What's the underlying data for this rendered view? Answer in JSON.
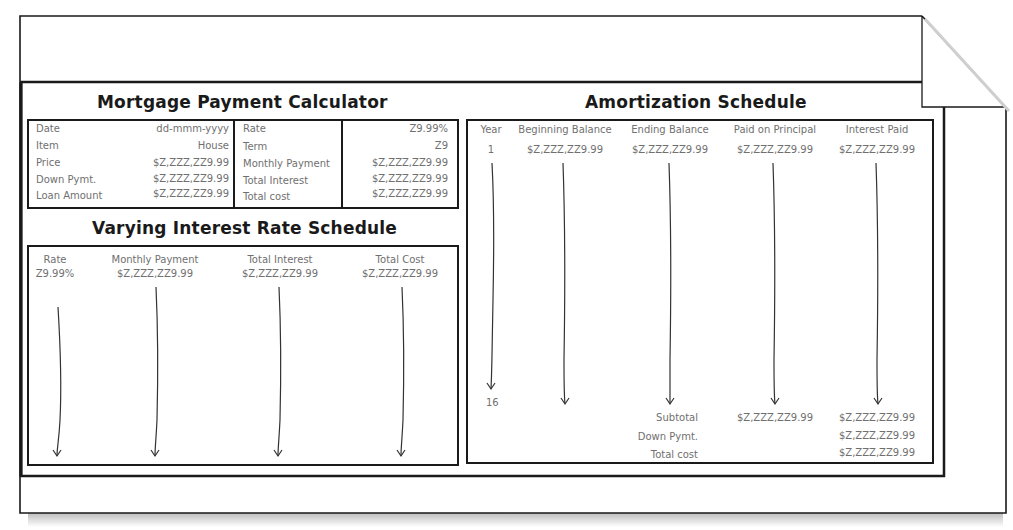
{
  "calculator": {
    "title": "Mortgage Payment Calculator",
    "left_rows": [
      {
        "label": "Date",
        "value": "dd-mmm-yyyy"
      },
      {
        "label": "Item",
        "value": "House"
      },
      {
        "label": "Price",
        "value": "$Z,ZZZ,ZZ9.99"
      },
      {
        "label": "Down Pymt.",
        "value": "$Z,ZZZ,ZZ9.99"
      },
      {
        "label": "Loan Amount",
        "value": "$Z,ZZZ,ZZ9.99"
      }
    ],
    "right_rows": [
      {
        "label": "Rate",
        "value": "Z9.99%"
      },
      {
        "label": "Term",
        "value": "Z9"
      },
      {
        "label": "Monthly Payment",
        "value": "$Z,ZZZ,ZZ9.99"
      },
      {
        "label": "Total Interest",
        "value": "$Z,ZZZ,ZZ9.99"
      },
      {
        "label": "Total cost",
        "value": "$Z,ZZZ,ZZ9.99"
      }
    ]
  },
  "varying": {
    "title": "Varying Interest Rate Schedule",
    "columns": [
      {
        "header": "Rate",
        "value": "Z9.99%"
      },
      {
        "header": "Monthly Payment",
        "value": "$Z,ZZZ,ZZ9.99"
      },
      {
        "header": "Total Interest",
        "value": "$Z,ZZZ,ZZ9.99"
      },
      {
        "header": "Total Cost",
        "value": "$Z,ZZZ,ZZ9.99"
      }
    ]
  },
  "amortization": {
    "title": "Amortization Schedule",
    "columns": [
      {
        "header": "Year",
        "value": "1"
      },
      {
        "header": "Beginning Balance",
        "value": "$Z,ZZZ,ZZ9.99"
      },
      {
        "header": "Ending Balance",
        "value": "$Z,ZZZ,ZZ9.99"
      },
      {
        "header": "Paid on Principal",
        "value": "$Z,ZZZ,ZZ9.99"
      },
      {
        "header": "Interest Paid",
        "value": "$Z,ZZZ,ZZ9.99"
      }
    ],
    "last_year": "16",
    "summary": [
      {
        "label": "Subtotal",
        "principal": "$Z,ZZZ,ZZ9.99",
        "interest": "$Z,ZZZ,ZZ9.99"
      },
      {
        "label": "Down Pymt.",
        "principal": "",
        "interest": "$Z,ZZZ,ZZ9.99"
      },
      {
        "label": "Total cost",
        "principal": "",
        "interest": "$Z,ZZZ,ZZ9.99"
      }
    ]
  }
}
